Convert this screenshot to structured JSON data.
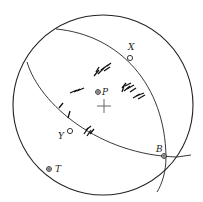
{
  "diagram": {
    "type": "stereonet",
    "primitive": {
      "cx": 103,
      "cy": 105,
      "r": 90
    },
    "center_mark": "cross",
    "great_circles": [
      {
        "name": "great-circle-1",
        "path": "M56,29 C120,35 165,85 166,157 C166,172 162,184 157,192"
      },
      {
        "name": "great-circle-2",
        "path": "M27,62 C40,105 100,155 177,157 L191,155"
      }
    ],
    "points": [
      {
        "label": "X",
        "x": 130,
        "y": 58,
        "symbol": "open-circle",
        "label_dx": 0,
        "label_dy": -8
      },
      {
        "label": "P",
        "x": 98,
        "y": 92,
        "symbol": "crossed-circle",
        "label_dx": 5,
        "label_dy": 3
      },
      {
        "label": "Y",
        "x": 70,
        "y": 131,
        "symbol": "open-circle",
        "label_dx": -12,
        "label_dy": 8
      },
      {
        "label": "B",
        "x": 164,
        "y": 156,
        "symbol": "crossed-circle",
        "label_dx": -8,
        "label_dy": -5
      },
      {
        "label": "T",
        "x": 49,
        "y": 169,
        "symbol": "crossed-circle",
        "label_dx": 6,
        "label_dy": 3
      }
    ],
    "data_clusters": [
      {
        "name": "cluster-upper",
        "x": 100,
        "y": 70
      },
      {
        "name": "cluster-right",
        "x": 132,
        "y": 90
      },
      {
        "name": "cluster-left",
        "x": 77,
        "y": 90
      },
      {
        "name": "cluster-lower",
        "x": 89,
        "y": 131
      },
      {
        "name": "cluster-far-left",
        "x": 62,
        "y": 105
      }
    ],
    "colors": {
      "line": "#222222",
      "background": "#ffffff"
    }
  }
}
